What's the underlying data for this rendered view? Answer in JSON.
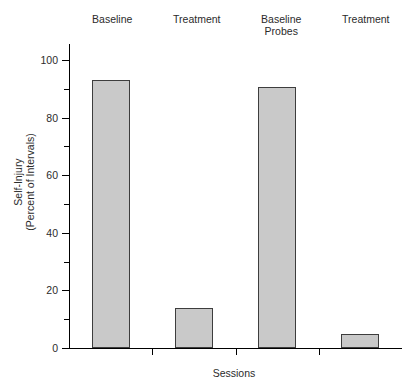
{
  "figure": {
    "cropped_top_text": "",
    "axis_color": "#000000",
    "bar_fill": "#c9c9c9",
    "bar_edge": "#3d3d3d"
  },
  "chart_data": {
    "type": "bar",
    "title": "",
    "xlabel": "Sessions",
    "ylabel": "Self-Injury\n(Percent of Intervals)",
    "categories": [
      "Baseline",
      "Treatment",
      "Baseline\nProbes",
      "Treatment"
    ],
    "values": [
      93,
      14,
      90.5,
      5
    ],
    "ylim": [
      0,
      100
    ],
    "ymajor_ticks": [
      0,
      20,
      40,
      60,
      80,
      100
    ],
    "yminor_ticks": [
      10,
      30,
      50,
      70,
      90
    ],
    "ytick_labels": [
      "0",
      "20",
      "40",
      "60",
      "80",
      "100"
    ],
    "grid": false,
    "legend": false
  }
}
